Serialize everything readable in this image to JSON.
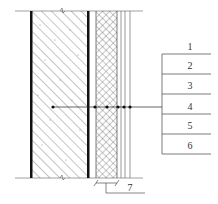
{
  "diagram": {
    "type": "wall-section-detail",
    "layer_labels": [
      "1",
      "2",
      "3",
      "4",
      "5",
      "6"
    ],
    "dimension_label": "7",
    "colors": {
      "line": "#333333",
      "thick_line": "#111111",
      "hatch": "#555555",
      "background": "#ffffff"
    }
  }
}
